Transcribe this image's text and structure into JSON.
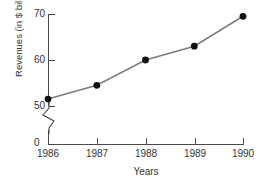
{
  "chart_data": {
    "type": "line",
    "title": "",
    "xlabel": "Years",
    "ylabel": "Revenues (in $ billions)",
    "categories": [
      "1986",
      "1987",
      "1988",
      "1989",
      "1990"
    ],
    "values": [
      51.5,
      54.5,
      60,
      63,
      69.5
    ],
    "series": [
      {
        "name": "Revenues",
        "values": [
          51.5,
          54.5,
          60,
          63,
          69.5
        ]
      }
    ],
    "ylim": [
      50,
      70
    ],
    "y_ticks": [
      "50",
      "60",
      "70"
    ],
    "y_zero_tick": "0",
    "x_ticks": [
      "1986",
      "1987",
      "1988",
      "1989",
      "1990"
    ],
    "grid": false,
    "legend": false,
    "axis_break": true,
    "axis_break_note": "zigzag break on y-axis between 0 and 50",
    "marker": "filled-circle",
    "colors": {
      "line": "#7d7d7d",
      "marker": "#101010",
      "axis": "#4a4a4a",
      "text": "#333333",
      "background": "#ffffff"
    }
  }
}
